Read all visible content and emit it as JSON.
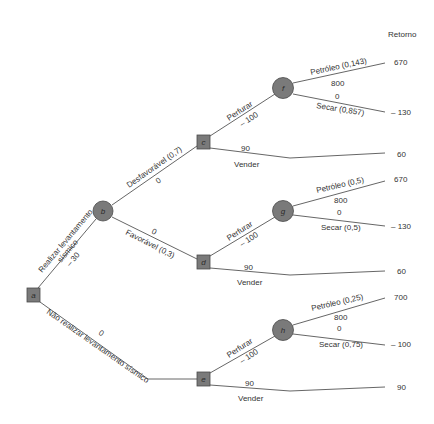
{
  "header": {
    "return_label": "Retorno"
  },
  "nodes": {
    "a": {
      "label": "a",
      "type": "decision"
    },
    "b": {
      "label": "b",
      "type": "chance"
    },
    "c": {
      "label": "c",
      "type": "decision"
    },
    "d": {
      "label": "d",
      "type": "decision"
    },
    "e": {
      "label": "e",
      "type": "decision"
    },
    "f": {
      "label": "f",
      "type": "chance"
    },
    "g": {
      "label": "g",
      "type": "chance"
    },
    "h": {
      "label": "h",
      "type": "chance"
    }
  },
  "branches": {
    "a_b": {
      "label_line1": "Realizar levantamento",
      "label_line2": "sísmico",
      "value": "– 30"
    },
    "a_e": {
      "label": "Não realizar levantamento sísmico",
      "value": "0"
    },
    "b_c": {
      "label": "Desfavorável (0,7)",
      "value": "0"
    },
    "b_d": {
      "label": "Favorável (0,3)",
      "value": "0"
    },
    "c_f": {
      "label": "Perfurar",
      "value": "– 100"
    },
    "c_sell": {
      "label": "Vender",
      "value": "90"
    },
    "d_g": {
      "label": "Perfurar",
      "value": "– 100"
    },
    "d_sell": {
      "label": "Vender",
      "value": "90"
    },
    "e_h": {
      "label": "Perfurar",
      "value": "– 100"
    },
    "e_sell": {
      "label": "Vender",
      "value": "90"
    },
    "f_oil": {
      "label": "Petróleo (0,143)",
      "value": "800"
    },
    "f_dry": {
      "label": "Secar (0,857)",
      "value": "0"
    },
    "g_oil": {
      "label": "Petróleo (0,5)",
      "value": "800"
    },
    "g_dry": {
      "label": "Secar (0,5)",
      "value": "0"
    },
    "h_oil": {
      "label": "Petróleo (0,25)",
      "value": "800"
    },
    "h_dry": {
      "label": "Secar (0,75)",
      "value": "0"
    }
  },
  "returns": [
    "670",
    "– 130",
    "60",
    "670",
    "– 130",
    "60",
    "700",
    "– 100",
    "90"
  ]
}
